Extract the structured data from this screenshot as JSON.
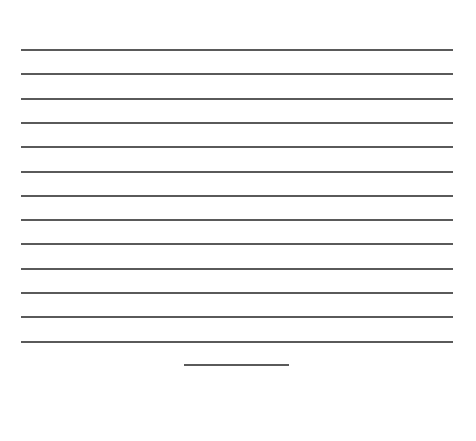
{
  "document": {
    "type": "blank-lined-sheet",
    "line_color": "#5a5a5a",
    "background_color": "#ffffff",
    "ruled_lines": {
      "count": 13,
      "first_y": 49,
      "spacing": 24.3,
      "x_start": 21,
      "x_end": 453
    },
    "short_line": {
      "x_start": 184,
      "x_end": 289,
      "y": 364
    }
  }
}
